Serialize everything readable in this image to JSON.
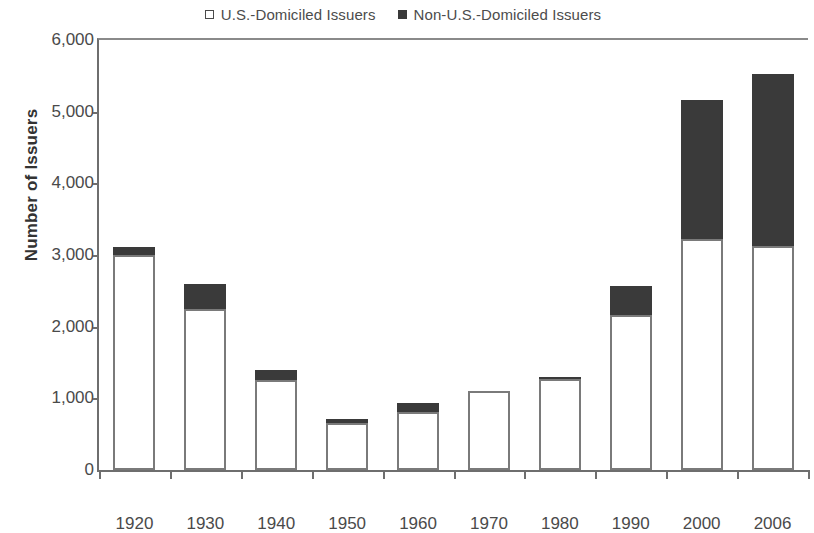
{
  "chart_data": {
    "type": "bar",
    "subtype": "stacked-vertical",
    "title": "",
    "xlabel": "",
    "ylabel": "Number of Issuers",
    "ylim": [
      0,
      6000
    ],
    "ytick_labels": [
      "6,000",
      "5,000",
      "4,000",
      "3,000",
      "2,000",
      "1,000",
      "0"
    ],
    "ytick_values": [
      6000,
      5000,
      4000,
      3000,
      2000,
      1000,
      0
    ],
    "grid": false,
    "legend_position": "top-center",
    "categories": [
      "1920",
      "1930",
      "1940",
      "1950",
      "1960",
      "1970",
      "1980",
      "1990",
      "2000",
      "2006"
    ],
    "series": [
      {
        "name": "U.S.-Domiciled Issuers",
        "color": "#ffffff",
        "edge_color": "#7a7a7a",
        "swatch": "hollow",
        "values": [
          3000,
          2250,
          1250,
          650,
          810,
          1100,
          1270,
          2160,
          3230,
          3120
        ]
      },
      {
        "name": "Non-U.S.-Domiciled Issuers",
        "color": "#3a3a3a",
        "swatch": "filled",
        "values": [
          110,
          350,
          150,
          60,
          120,
          0,
          10,
          410,
          1940,
          2410
        ]
      }
    ],
    "totals": [
      3110,
      2600,
      1400,
      710,
      930,
      1100,
      1280,
      2570,
      5170,
      5530
    ]
  },
  "legend": {
    "entries": [
      {
        "label": "U.S.-Domiciled Issuers",
        "swatch": "hollow"
      },
      {
        "label": "Non-U.S.-Domiciled Issuers",
        "swatch": "filled"
      }
    ]
  },
  "axes": {
    "y_title": "Number of Issuers"
  },
  "colors": {
    "non_us_fill": "#3a3a3a",
    "us_fill": "#ffffff",
    "bar_edge": "#7a7a7a",
    "axis": "#6e6e6e",
    "text": "#4a4a4a"
  }
}
